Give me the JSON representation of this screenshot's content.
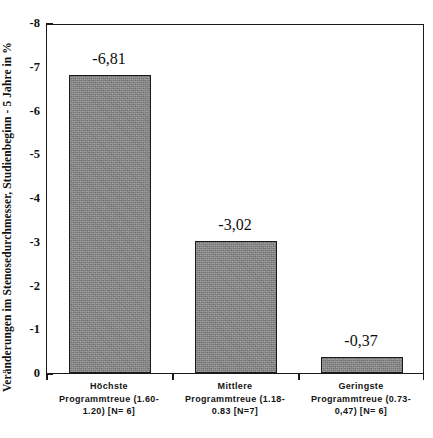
{
  "chart_data": {
    "type": "bar",
    "title": "",
    "subtitle": "",
    "xlabel": "",
    "ylabel": "Veränderungen im Stenosedurchmesser, Studienbeginn - 5 Jahre in %",
    "categories": [
      "Höchste Programmtreue (1.60-1.20) [N= 6]",
      "Mittlere Programmtreue (1.18-0.83 [N=7]",
      "Geringste Programmtreue (0.73-0,47) [N= 6]"
    ],
    "category_lines": [
      [
        "Höchste",
        "Programmtreue (1.60-",
        "1.20) [N= 6]"
      ],
      [
        "Mittlere",
        "Programmtreue (1.18-",
        "0.83 [N=7]"
      ],
      [
        "Geringste",
        "Programmtreue (0.73-",
        "0,47) [N= 6]"
      ]
    ],
    "values": [
      -6.81,
      -3.02,
      -0.37
    ],
    "value_labels": [
      "-6,81",
      "-3,02",
      "-0,37"
    ],
    "ylim": [
      0,
      -8
    ],
    "ytick_values": [
      0,
      -1,
      -2,
      -3,
      -4,
      -5,
      -6,
      -7,
      -8
    ],
    "ytick_labels": [
      "0",
      "-1",
      "-2",
      "-3",
      "-4",
      "-5",
      "-6",
      "-7",
      "-8"
    ],
    "y_axis_direction": "inverted",
    "grid": false,
    "legend": false,
    "legend_position": "none",
    "series": [
      {
        "name": "Veränderung Stenosedurchmesser",
        "values": [
          -6.81,
          -3.02,
          -0.37
        ]
      }
    ],
    "colors": {
      "bar_fill": "#878787",
      "bar_edge": "#1a1a1a",
      "axis": "#1a1a1a",
      "text": "#111111",
      "background": "#ffffff"
    }
  }
}
